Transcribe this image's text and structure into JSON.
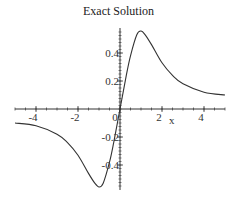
{
  "chart_data": {
    "type": "line",
    "title": "Exact Solution",
    "xlabel": "x",
    "ylabel": "",
    "xlim": [
      -5,
      5
    ],
    "ylim": [
      -0.56,
      0.56
    ],
    "grid": false,
    "legend": null,
    "x_ticks": [
      -4,
      -2,
      0,
      2,
      4
    ],
    "x_tick_labels": [
      "-4",
      "-2",
      "0",
      "2",
      "4"
    ],
    "y_ticks": [
      -0.4,
      -0.2,
      0.2,
      0.4
    ],
    "y_tick_labels": [
      "-0.4",
      "-0.2",
      "0.2",
      "0.4"
    ],
    "series": [
      {
        "name": "Exact Solution",
        "color": "#333333",
        "x": [
          -5,
          -4,
          -3,
          -2.5,
          -2,
          -1.5,
          -1.2,
          -1,
          -0.8,
          -0.5,
          -0.3,
          0,
          0.3,
          0.5,
          0.8,
          1,
          1.2,
          1.5,
          2,
          2.5,
          3,
          4,
          5
        ],
        "y": [
          -0.1,
          -0.12,
          -0.18,
          -0.24,
          -0.33,
          -0.46,
          -0.53,
          -0.557,
          -0.53,
          -0.38,
          -0.24,
          0,
          0.24,
          0.38,
          0.53,
          0.557,
          0.53,
          0.46,
          0.33,
          0.24,
          0.18,
          0.12,
          0.1
        ]
      }
    ]
  },
  "title": "Exact Solution",
  "axis": {
    "x_label": "x"
  }
}
